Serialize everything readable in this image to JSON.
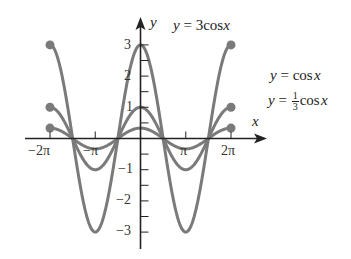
{
  "chart_data": {
    "type": "line",
    "title": "",
    "xlabel": "x",
    "ylabel": "y",
    "xlim": [
      -6.9,
      7.5
    ],
    "ylim": [
      -3.5,
      3.8
    ],
    "x_ticks": [
      {
        "value": -6.2832,
        "label": "−2π"
      },
      {
        "value": -3.1416,
        "label": "−π"
      },
      {
        "value": 3.1416,
        "label": "π"
      },
      {
        "value": 6.2832,
        "label": "2π"
      }
    ],
    "y_ticks": [
      {
        "value": 3,
        "label": "3"
      },
      {
        "value": 2,
        "label": "2"
      },
      {
        "value": 1,
        "label": "1"
      },
      {
        "value": -1,
        "label": "−1"
      },
      {
        "value": -2,
        "label": "−2"
      },
      {
        "value": -3,
        "label": "−3"
      }
    ],
    "grid": false,
    "domain": [
      -6.2832,
      6.2832
    ],
    "series": [
      {
        "name": "y = 3cos x",
        "amplitude": 3,
        "x": [
          -6.2832,
          -4.7124,
          -3.1416,
          -1.5708,
          0,
          1.5708,
          3.1416,
          4.7124,
          6.2832
        ],
        "values": [
          3,
          0,
          -3,
          0,
          3,
          0,
          -3,
          0,
          3
        ]
      },
      {
        "name": "y = cos x",
        "amplitude": 1,
        "x": [
          -6.2832,
          -4.7124,
          -3.1416,
          -1.5708,
          0,
          1.5708,
          3.1416,
          4.7124,
          6.2832
        ],
        "values": [
          1,
          0,
          -1,
          0,
          1,
          0,
          -1,
          0,
          1
        ]
      },
      {
        "name": "y = (1/3) cos x",
        "amplitude": 0.3333,
        "x": [
          -6.2832,
          -4.7124,
          -3.1416,
          -1.5708,
          0,
          1.5708,
          3.1416,
          4.7124,
          6.2832
        ],
        "values": [
          0.333,
          0,
          -0.333,
          0,
          0.333,
          0,
          -0.333,
          0,
          0.333
        ]
      }
    ],
    "endpoint_markers": true,
    "annotations": [
      "y = 3cos x",
      "y = cos x",
      "y = 1/3 cos x"
    ]
  },
  "labels": {
    "y_axis": "y",
    "x_axis": "x",
    "curve_3cos": {
      "pre": "y",
      "eq": " = 3cos",
      "var": "x"
    },
    "curve_cos": {
      "pre": "y",
      "eq": " = cos",
      "var": "x"
    },
    "curve_third": {
      "pre": "y",
      "eq": " = ",
      "num": "1",
      "den": "3",
      "fn": "cos",
      "var": "x"
    }
  },
  "colors": {
    "curve": "#7a7a7a",
    "axis": "#222222",
    "text": "#222222"
  }
}
